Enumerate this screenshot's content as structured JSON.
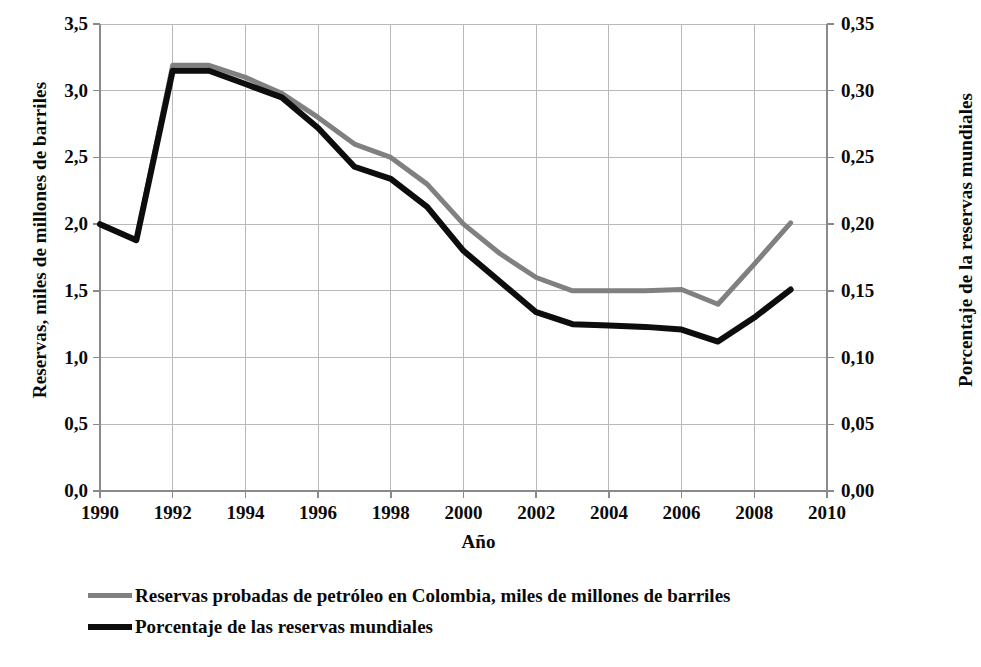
{
  "chart_data": {
    "type": "line",
    "title": "",
    "xlabel": "Año",
    "ylabel": "Reservas, miles de millones de barriles",
    "ylabel_right": "Porcentaje de la reservas mundiales",
    "grid": true,
    "legend_position": "bottom-left",
    "xlim": [
      1990,
      2010
    ],
    "ylim": [
      0.0,
      3.5
    ],
    "ylim_right": [
      0.0,
      0.35
    ],
    "x": [
      1990,
      1991,
      1992,
      1993,
      1994,
      1995,
      1996,
      1997,
      1998,
      1999,
      2000,
      2001,
      2002,
      2003,
      2004,
      2005,
      2006,
      2007,
      2008,
      2009
    ],
    "xticks": [
      "1990",
      "1992",
      "1994",
      "1996",
      "1998",
      "2000",
      "2002",
      "2004",
      "2006",
      "2008",
      "2010"
    ],
    "xtick_values": [
      1990,
      1992,
      1994,
      1996,
      1998,
      2000,
      2002,
      2004,
      2006,
      2008,
      2010
    ],
    "yticks_left": [
      "0,0",
      "0,5",
      "1,0",
      "1,5",
      "2,0",
      "2,5",
      "3,0",
      "3,5"
    ],
    "ytick_values_left": [
      0.0,
      0.5,
      1.0,
      1.5,
      2.0,
      2.5,
      3.0,
      3.5
    ],
    "yticks_right": [
      "0,00",
      "0,05",
      "0,10",
      "0,15",
      "0,20",
      "0,25",
      "0,30",
      "0,35"
    ],
    "ytick_values_right": [
      0.0,
      0.05,
      0.1,
      0.15,
      0.2,
      0.25,
      0.3,
      0.35
    ],
    "series": [
      {
        "name": "Reservas probadas de petróleo en Colombia, miles de millones de barriles",
        "axis": "left",
        "color": "#808080",
        "width": 5,
        "values": [
          2.0,
          1.88,
          3.19,
          3.19,
          3.1,
          2.98,
          2.8,
          2.6,
          2.5,
          2.3,
          2.0,
          1.78,
          1.6,
          1.5,
          1.5,
          1.5,
          1.51,
          1.4,
          1.7,
          2.01
        ]
      },
      {
        "name": "Porcentaje de las reservas mundiales",
        "axis": "right",
        "color": "#0d0d0d",
        "width": 6,
        "values": [
          0.2,
          0.188,
          0.315,
          0.315,
          0.305,
          0.295,
          0.272,
          0.243,
          0.234,
          0.213,
          0.18,
          0.157,
          0.134,
          0.125,
          0.124,
          0.123,
          0.121,
          0.112,
          0.13,
          0.151
        ]
      }
    ]
  },
  "legend": {
    "items": [
      {
        "label": "Reservas probadas de petróleo en Colombia, miles de millones de barriles"
      },
      {
        "label": "Porcentaje de las reservas mundiales"
      }
    ]
  },
  "axes": {
    "x_title": "Año",
    "y_left_title": "Reservas, miles de millones de barriles",
    "y_right_title": "Porcentaje de la reservas mundiales"
  },
  "colors": {
    "series_gray": "#808080",
    "series_black": "#0d0d0d",
    "grid": "#b9b9b9",
    "axis": "#8a8a8a",
    "text": "#0a0a0a",
    "background": "#ffffff"
  }
}
